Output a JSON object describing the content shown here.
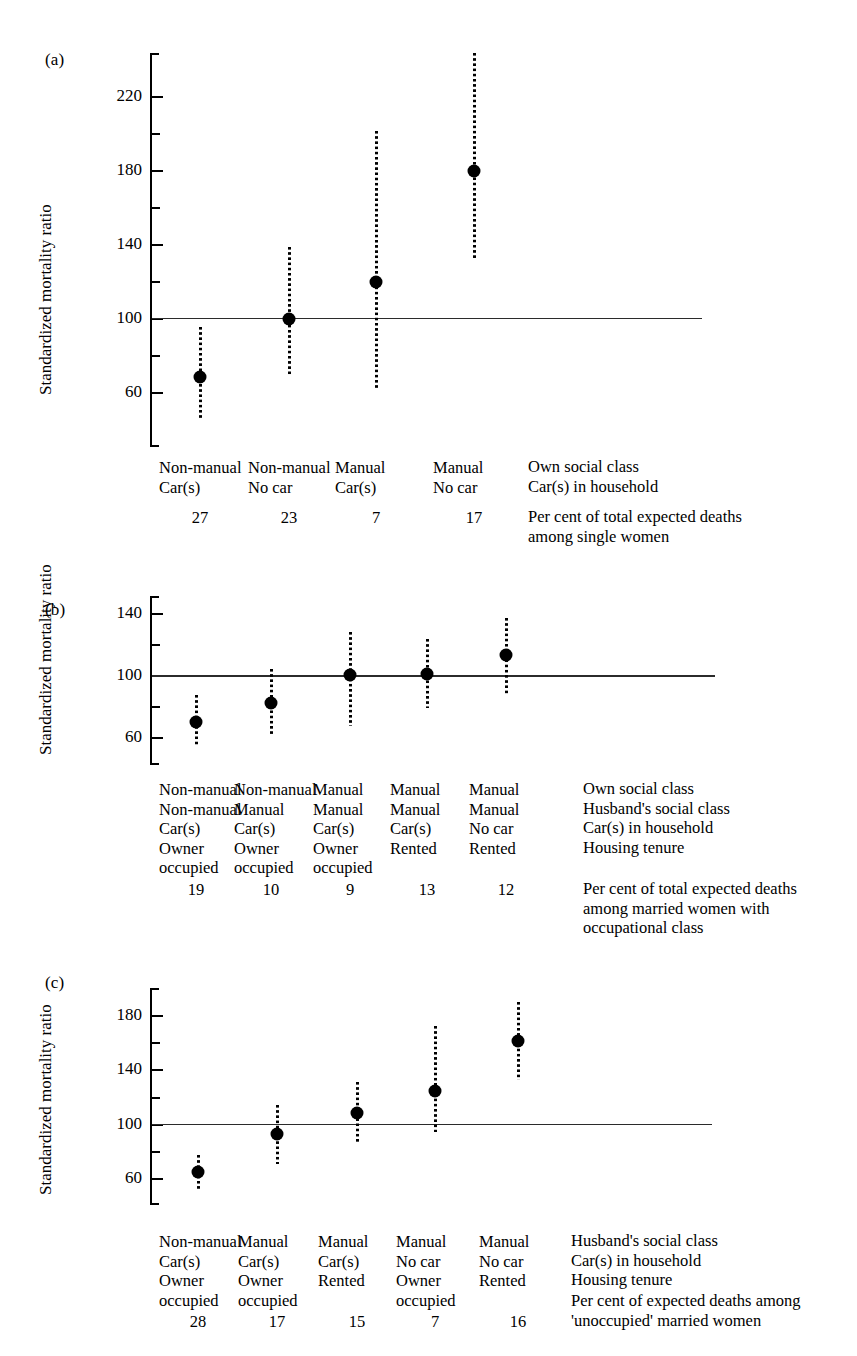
{
  "figure": {
    "ylabel": "Standardized mortality ratio"
  },
  "chart_data": [
    {
      "type": "scatter",
      "panel": "(a)",
      "title": "",
      "xlabel": "",
      "ylabel": "Standardized mortality ratio",
      "ylim": [
        30,
        243
      ],
      "ytick_major": [
        220,
        180,
        140,
        100,
        60
      ],
      "ytick_minor": [
        200,
        160,
        120,
        80
      ],
      "ytick_labels": [
        "220",
        "180",
        "140",
        "100",
        "60"
      ],
      "reference_line": 100,
      "grid": false,
      "legend": "none",
      "categories": [
        "Non-manual\nCar(s)",
        "Non-manual\nNo car",
        "Manual\nCar(s)",
        "Manual\nNo car"
      ],
      "values": [
        68,
        99,
        119,
        179
      ],
      "error_low": [
        45,
        69,
        62,
        131
      ],
      "error_high": [
        95,
        138,
        201,
        243
      ],
      "percentages": [
        "27",
        "23",
        "7",
        "17"
      ],
      "row_labels": [
        "Own social class",
        "Car(s) in household"
      ],
      "pct_note": "Per cent of total expected deaths\namong single women"
    },
    {
      "type": "scatter",
      "panel": "(b)",
      "title": "",
      "xlabel": "",
      "ylabel": "Standardized mortality ratio",
      "ylim": [
        42,
        151
      ],
      "ytick_major": [
        140,
        100,
        60
      ],
      "ytick_minor": [
        120,
        80
      ],
      "ytick_labels": [
        "140",
        "100",
        "60"
      ],
      "reference_line": 100,
      "grid": false,
      "legend": "none",
      "categories": [
        "Non-manual\nNon-manual\nCar(s)\nOwner\noccupied",
        "Non-manual\nManual\nCar(s)\nOwner\noccupied",
        "Manual\nManual\nCar(s)\nOwner\noccupied",
        "Manual\nManual\nCar(s)\nRented",
        "Manual\nManual\nNo car\nRented"
      ],
      "values": [
        70,
        82,
        100,
        101,
        113
      ],
      "error_low": [
        55,
        62,
        67,
        79,
        87
      ],
      "error_high": [
        87,
        104,
        128,
        123,
        137
      ],
      "percentages": [
        "19",
        "10",
        "9",
        "13",
        "12"
      ],
      "row_labels": [
        "Own social class",
        "Husband's social class",
        "Car(s) in household",
        "Housing tenure"
      ],
      "pct_note": "Per cent of total expected deaths\namong married women with\noccupational class"
    },
    {
      "type": "scatter",
      "panel": "(c)",
      "title": "",
      "xlabel": "",
      "ylabel": "Standardized mortality ratio",
      "ylim": [
        40,
        200
      ],
      "ytick_major": [
        180,
        140,
        100,
        60
      ],
      "ytick_minor": [
        160,
        120,
        80
      ],
      "ytick_labels": [
        "180",
        "140",
        "100",
        "60"
      ],
      "reference_line": 100,
      "grid": false,
      "legend": "none",
      "categories": [
        "Non-manual\nCar(s)\nOwner\noccupied",
        "Manual\nCar(s)\nOwner\noccupied",
        "Manual\nCar(s)\nRented",
        "Manual\nNo car\nOwner\noccupied",
        "Manual\nNo car\nRented"
      ],
      "values": [
        64,
        92,
        108,
        124,
        161
      ],
      "error_low": [
        52,
        70,
        86,
        94,
        132
      ],
      "error_high": [
        77,
        114,
        131,
        172,
        190
      ],
      "percentages": [
        "28",
        "17",
        "15",
        "7",
        "16"
      ],
      "row_labels": [
        "Husband's social class",
        "Car(s) in household",
        "Housing tenure"
      ],
      "pct_note": "Per cent of expected deaths among\n'unoccupied' married women"
    }
  ]
}
